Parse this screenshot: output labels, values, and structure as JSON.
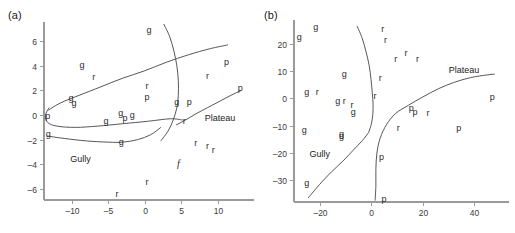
{
  "figure": {
    "background": "#ffffff",
    "axis_color": "#9a9a9a",
    "curve_color": "#444444",
    "text_color": "#2b2b2b"
  },
  "chart_data": [
    {
      "type": "scatter",
      "panel_label": "(a)",
      "title": "",
      "xlabel": "",
      "ylabel": "",
      "xlim": [
        -13.8,
        13.6
      ],
      "ylim": [
        -6.9,
        7.4
      ],
      "xticks": [
        -10,
        -5,
        0,
        5,
        10
      ],
      "xticklabels": [
        "–10",
        "–5",
        "0",
        "5",
        "10"
      ],
      "yticks": [
        6,
        4,
        2,
        0,
        -2,
        -4,
        -6
      ],
      "yticklabels": [
        "6",
        "4",
        "2",
        "0",
        "–2",
        "–4",
        "–6"
      ],
      "grid": false,
      "legend": false,
      "point_label_field": "label",
      "points": [
        {
          "label": "g",
          "x": 0.6,
          "y": 6.9
        },
        {
          "label": "g",
          "x": -8.6,
          "y": 4.1
        },
        {
          "label": "p",
          "x": 11.2,
          "y": 4.3
        },
        {
          "label": "r",
          "x": -7.0,
          "y": 3.1
        },
        {
          "label": "r",
          "x": 8.6,
          "y": 3.2
        },
        {
          "label": "r",
          "x": 0.3,
          "y": 2.4
        },
        {
          "label": "p",
          "x": 13.1,
          "y": 2.2
        },
        {
          "label": "p",
          "x": 0.3,
          "y": 1.5
        },
        {
          "label": "g",
          "x": -10.1,
          "y": 1.4
        },
        {
          "label": "g",
          "x": -9.7,
          "y": 1.0
        },
        {
          "label": "g",
          "x": 4.4,
          "y": 1.1
        },
        {
          "label": "p",
          "x": 6.1,
          "y": 1.1
        },
        {
          "label": "p",
          "x": -13.3,
          "y": -0.1
        },
        {
          "label": "g",
          "x": -3.3,
          "y": 0.2
        },
        {
          "label": "p",
          "x": -2.7,
          "y": -0.2
        },
        {
          "label": "g",
          "x": -1.7,
          "y": 0.0
        },
        {
          "label": "g",
          "x": -5.3,
          "y": -0.5
        },
        {
          "label": "r",
          "x": 5.4,
          "y": -0.5
        },
        {
          "label": "g",
          "x": -13.2,
          "y": -1.5
        },
        {
          "label": "g",
          "x": -3.2,
          "y": -2.2
        },
        {
          "label": "r",
          "x": 7.0,
          "y": -2.3
        },
        {
          "label": "r",
          "x": 8.6,
          "y": -2.5
        },
        {
          "label": "r",
          "x": 9.4,
          "y": -2.8
        },
        {
          "label": "f",
          "x": 4.6,
          "y": -4.0,
          "italic": true
        },
        {
          "label": "r",
          "x": 0.3,
          "y": -5.4
        },
        {
          "label": "r",
          "x": -3.8,
          "y": -6.4
        }
      ],
      "annotations": [
        {
          "text": "Plateau",
          "x": 10.3,
          "y": -0.2
        },
        {
          "text": "Gully",
          "x": -8.8,
          "y": -3.6
        }
      ],
      "curves": [
        {
          "name": "plateau-boundary-upper",
          "points": [
            [
              -13.2,
              0.4
            ],
            [
              -11.5,
              1.0
            ],
            [
              -9.0,
              1.6
            ],
            [
              -6.0,
              2.3
            ],
            [
              -3.0,
              3.0
            ],
            [
              0.0,
              3.6
            ],
            [
              3.0,
              4.3
            ],
            [
              6.0,
              4.9
            ],
            [
              9.0,
              5.4
            ],
            [
              11.4,
              5.7
            ]
          ]
        },
        {
          "name": "ridge-crossing-curve",
          "points": [
            [
              2.6,
              7.4
            ],
            [
              3.4,
              6.4
            ],
            [
              4.0,
              5.2
            ],
            [
              4.4,
              4.0
            ],
            [
              4.6,
              2.8
            ],
            [
              4.6,
              1.6
            ],
            [
              4.4,
              0.6
            ],
            [
              3.9,
              -0.4
            ],
            [
              3.2,
              -1.3
            ],
            [
              2.2,
              -2.1
            ]
          ]
        },
        {
          "name": "gully-loop-upper",
          "points": [
            [
              -13.1,
              0.6
            ],
            [
              -13.6,
              0.0
            ],
            [
              -13.3,
              -0.6
            ],
            [
              -12.0,
              -0.9
            ],
            [
              -9.5,
              -1.0
            ],
            [
              -6.5,
              -0.9
            ],
            [
              -3.0,
              -0.7
            ],
            [
              0.5,
              -0.5
            ],
            [
              3.5,
              -0.3
            ],
            [
              5.2,
              -0.4
            ]
          ]
        },
        {
          "name": "gully-loop-lower",
          "points": [
            [
              -13.4,
              -1.7
            ],
            [
              -11.0,
              -1.9
            ],
            [
              -8.0,
              -2.1
            ],
            [
              -5.0,
              -2.2
            ],
            [
              -3.0,
              -2.2
            ],
            [
              -1.0,
              -2.0
            ],
            [
              0.8,
              -1.6
            ],
            [
              2.2,
              -1.0
            ]
          ]
        },
        {
          "name": "plateau-boundary-lower",
          "points": [
            [
              4.3,
              -0.8
            ],
            [
              5.6,
              -0.4
            ],
            [
              7.0,
              0.1
            ],
            [
              8.6,
              0.6
            ],
            [
              10.2,
              1.1
            ],
            [
              11.8,
              1.6
            ],
            [
              13.2,
              2.0
            ]
          ]
        }
      ]
    },
    {
      "type": "scatter",
      "panel_label": "(b)",
      "title": "",
      "xlabel": "",
      "ylabel": "",
      "xlim": [
        -30,
        50
      ],
      "ylim": [
        -38,
        28
      ],
      "xticks": [
        -20,
        0,
        20,
        40
      ],
      "xticklabels": [
        "–20",
        "0",
        "20",
        "40"
      ],
      "yticks": [
        20,
        10,
        0,
        -10,
        -20,
        -30
      ],
      "yticklabels": [
        "20",
        "10",
        "0",
        "–10",
        "–20",
        "–30"
      ],
      "grid": false,
      "legend": false,
      "point_label_field": "label",
      "points": [
        {
          "label": "g",
          "x": -21.5,
          "y": 26.0
        },
        {
          "label": "r",
          "x": 4.5,
          "y": 25.5
        },
        {
          "label": "g",
          "x": -28.0,
          "y": 22.5
        },
        {
          "label": "r",
          "x": 5.5,
          "y": 21.5
        },
        {
          "label": "r",
          "x": 13.5,
          "y": 16.5
        },
        {
          "label": "r",
          "x": 9.5,
          "y": 14.5
        },
        {
          "label": "r",
          "x": 18.0,
          "y": 14.5
        },
        {
          "label": "g",
          "x": -10.5,
          "y": 9.0
        },
        {
          "label": "r",
          "x": 3.5,
          "y": 7.5
        },
        {
          "label": "g",
          "x": -25.0,
          "y": 2.5
        },
        {
          "label": "r",
          "x": -21.0,
          "y": 2.5
        },
        {
          "label": "r",
          "x": 1.5,
          "y": 1.0
        },
        {
          "label": "p",
          "x": 47.0,
          "y": 0.5
        },
        {
          "label": "g",
          "x": -13.0,
          "y": -1.0
        },
        {
          "label": "r",
          "x": -10.5,
          "y": -1.0
        },
        {
          "label": "r",
          "x": -7.5,
          "y": -2.5
        },
        {
          "label": "p",
          "x": 15.5,
          "y": -3.5
        },
        {
          "label": "g",
          "x": -7.0,
          "y": -5.0
        },
        {
          "label": "p",
          "x": 17.0,
          "y": -5.0
        },
        {
          "label": "r",
          "x": 22.0,
          "y": -5.5
        },
        {
          "label": "g",
          "x": -26.0,
          "y": -11.5
        },
        {
          "label": "r",
          "x": 10.5,
          "y": -11.0
        },
        {
          "label": "p",
          "x": 34.0,
          "y": -11.0
        },
        {
          "label": "g",
          "x": -11.5,
          "y": -13.0
        },
        {
          "label": "g",
          "x": -11.5,
          "y": -13.8
        },
        {
          "label": "p",
          "x": 4.0,
          "y": -21.5
        },
        {
          "label": "g",
          "x": -25.0,
          "y": -31.0
        },
        {
          "label": "p",
          "x": 5.0,
          "y": -37.0
        }
      ],
      "annotations": [
        {
          "text": "Plateau",
          "x": 36.0,
          "y": 10.5
        },
        {
          "text": "Gully",
          "x": -20.0,
          "y": -20.5
        }
      ],
      "curves": [
        {
          "name": "upper-gully-boundary",
          "points": [
            [
              -5.5,
              26.5
            ],
            [
              -3.5,
              22.0
            ],
            [
              -2.0,
              17.0
            ],
            [
              -0.8,
              12.0
            ],
            [
              -0.1,
              7.0
            ],
            [
              0.4,
              2.0
            ],
            [
              0.7,
              -2.0
            ],
            [
              0.6,
              -6.0
            ],
            [
              0.0,
              -9.5
            ],
            [
              -1.0,
              -12.5
            ]
          ]
        },
        {
          "name": "gully-boundary-lower",
          "points": [
            [
              -1.0,
              -12.5
            ],
            [
              -3.5,
              -15.5
            ],
            [
              -7.0,
              -19.0
            ],
            [
              -11.0,
              -23.0
            ],
            [
              -15.5,
              -27.0
            ],
            [
              -20.0,
              -31.5
            ],
            [
              -24.5,
              -36.5
            ]
          ]
        },
        {
          "name": "plateau-boundary",
          "points": [
            [
              1.5,
              -37.5
            ],
            [
              1.8,
              -32.0
            ],
            [
              1.8,
              -26.0
            ],
            [
              2.2,
              -20.0
            ],
            [
              3.5,
              -14.5
            ],
            [
              6.0,
              -9.5
            ],
            [
              9.5,
              -5.5
            ],
            [
              14.5,
              -2.5
            ],
            [
              20.0,
              0.5
            ],
            [
              26.0,
              3.5
            ],
            [
              32.0,
              5.8
            ],
            [
              38.5,
              7.6
            ],
            [
              45.0,
              8.6
            ],
            [
              48.0,
              8.9
            ]
          ]
        }
      ]
    }
  ]
}
